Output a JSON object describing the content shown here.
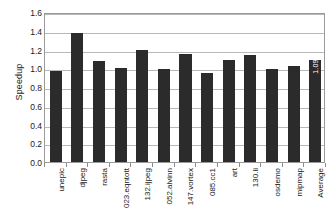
{
  "chart_data": {
    "type": "bar",
    "title": "",
    "xlabel": "",
    "ylabel": "Speedup",
    "ylim": [
      0.0,
      1.6
    ],
    "ytick_step": 0.2,
    "grid": true,
    "legend": "none",
    "bar_color": "#2b2b2b",
    "categories": [
      "unepic",
      "djpeg",
      "rasta",
      "023.eqntott",
      "132.ijpeg",
      "052.alvinn",
      "147.vortex",
      "085.cc1",
      "art",
      "130.li",
      "osdemo",
      "mipmap",
      "Average"
    ],
    "values": [
      0.97,
      1.38,
      1.08,
      1.0,
      1.19,
      0.99,
      1.15,
      0.95,
      1.09,
      1.14,
      0.99,
      1.02,
      1.09
    ],
    "ytick_labels": [
      "0.0",
      "0.2",
      "0.4",
      "0.6",
      "0.8",
      "1.0",
      "1.2",
      "1.4",
      "1.6"
    ],
    "ytick_values": [
      0.0,
      0.2,
      0.4,
      0.6,
      0.8,
      1.0,
      1.2,
      1.4,
      1.6
    ],
    "data_labels": [
      {
        "category": "Average",
        "text": "1.09",
        "color": "#ffffff"
      }
    ]
  }
}
